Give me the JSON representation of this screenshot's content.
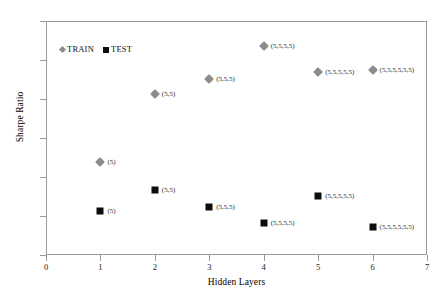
{
  "chart_data": {
    "type": "scatter",
    "title": "",
    "xlabel": "Hidden Layers",
    "ylabel": "Sharpe Ratio",
    "xlim": [
      0,
      7
    ],
    "ylim": [
      -1,
      5
    ],
    "xticks": [
      "0",
      "1",
      "2",
      "3",
      "4",
      "5",
      "6",
      "7"
    ],
    "yticks": [
      "5",
      "4",
      "3",
      "2",
      "1",
      "0",
      "-1"
    ],
    "xtick_values": [
      0,
      1,
      2,
      3,
      4,
      5,
      6,
      7
    ],
    "ytick_values": [
      5,
      4,
      3,
      2,
      1,
      0,
      -1
    ],
    "grid": false,
    "legend_position": "upper-left-inside",
    "legend": [
      "TRAIN",
      "TEST"
    ],
    "colors": {
      "train": "#8c8c8c",
      "test": "#0d0d0d",
      "axis": "#9a9a9a",
      "text": "#000000",
      "background": "#ffffff"
    },
    "series": [
      {
        "name": "TRAIN",
        "marker": "diamond",
        "color": "#8c8c8c",
        "x": [
          1,
          2,
          3,
          4,
          5,
          6
        ],
        "values": [
          1.38,
          3.13,
          3.52,
          4.35,
          3.68,
          3.75
        ],
        "point_labels": [
          "(5)",
          "(5,5)",
          "(5,5,5)",
          "(5,5,5,5)",
          "(5,5,5,5,5)",
          "(5,5,5,5,5,5)"
        ]
      },
      {
        "name": "TEST",
        "marker": "square",
        "color": "#0d0d0d",
        "x": [
          1,
          2,
          3,
          4,
          5,
          6
        ],
        "values": [
          0.13,
          0.67,
          0.22,
          -0.17,
          0.52,
          -0.27
        ],
        "point_labels": [
          "(5)",
          "(5,5)",
          "(5,5,5)",
          "(5,5,5,5)",
          "(5,5,5,5,5)",
          "(5,5,5,5,5,5)"
        ]
      }
    ]
  }
}
